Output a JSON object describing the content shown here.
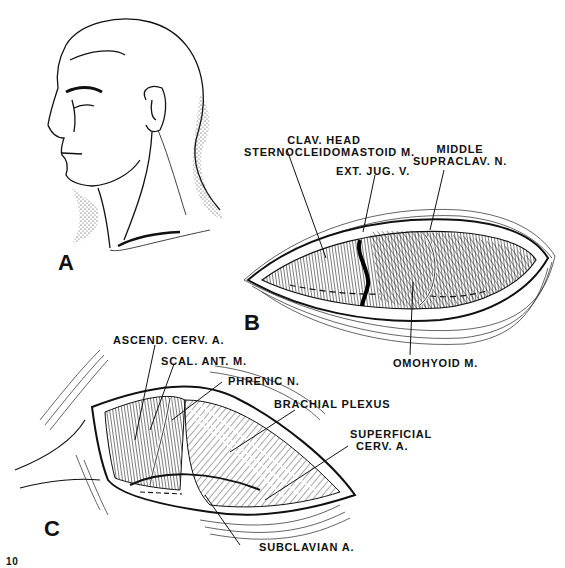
{
  "figure": {
    "panels": [
      {
        "id": "A",
        "label": "A"
      },
      {
        "id": "B",
        "label": "B"
      },
      {
        "id": "C",
        "label": "C"
      }
    ],
    "labels_b": {
      "clav_head_line1": "CLAV. HEAD",
      "clav_head_line2": "STERNOCLEIDOMASTOID M.",
      "ext_jug": "EXT. JUG. V.",
      "middle_supraclav_line1": "MIDDLE",
      "middle_supraclav_line2": "SUPRACLAV. N.",
      "omohyoid": "OMOHYOID M."
    },
    "labels_c": {
      "ascend_cerv": "ASCEND. CERV. A.",
      "scal_ant": "SCAL. ANT. M.",
      "phrenic": "PHRENIC N.",
      "brachial_plexus": "BRACHIAL PLEXUS",
      "superficial_line1": "SUPERFICIAL",
      "superficial_line2": "CERV. A.",
      "subclavian": "SUBCLAVIAN A."
    },
    "page_number": "10"
  }
}
